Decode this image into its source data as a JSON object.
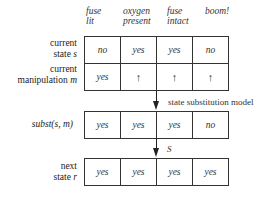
{
  "columns": [
    {
      "line1": "fuse",
      "line2": "lit"
    },
    {
      "line1": "oxygen",
      "line2": "present"
    },
    {
      "line1": "fuse",
      "line2": "intact"
    },
    {
      "line1": "boom!",
      "line2": ""
    }
  ],
  "rows": {
    "current_state": {
      "label_line1": "current",
      "label_line2_text": "state ",
      "label_line2_var": "s",
      "values": [
        "no",
        "yes",
        "yes",
        "no"
      ]
    },
    "current_manipulation": {
      "label_line1": "current",
      "label_line2_text": "manipulation ",
      "label_line2_var": "m",
      "values": [
        "yes",
        "↑",
        "↑",
        "↑"
      ]
    },
    "subst": {
      "label": "subst(s, m)",
      "values": [
        "yes",
        "yes",
        "yes",
        "no"
      ]
    },
    "next_state": {
      "label_line1": "next",
      "label_line2_text": "state ",
      "label_line2_var": "r",
      "values": [
        "yes",
        "yes",
        "yes",
        "yes"
      ]
    }
  },
  "arrows": {
    "first_label": "state substitution model",
    "second_label": "S"
  }
}
